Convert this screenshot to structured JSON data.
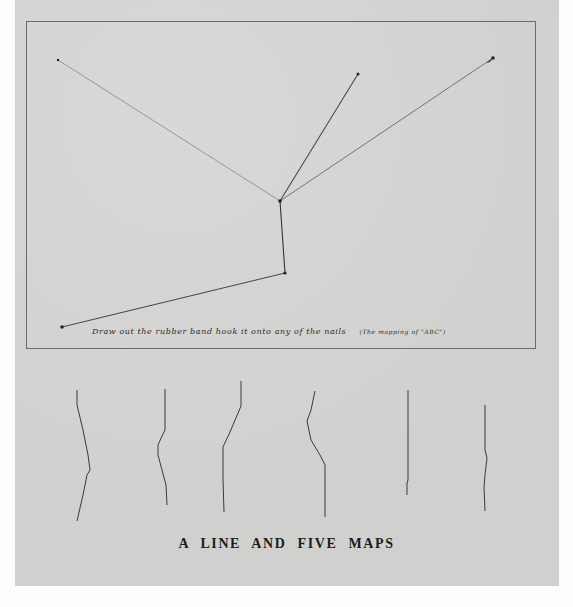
{
  "artwork": {
    "title": "A LINE AND FIVE MAPS",
    "instruction": "Draw out the rubber band hook it onto any of the nails",
    "instruction_note": "(The mapping of \"ABC\")",
    "colors": {
      "paper": "#d4d4d2",
      "background": "#fdfdfd",
      "ink": "#3a3a3a",
      "frame": "#6b6b6b"
    },
    "nails": [
      {
        "id": "top-left",
        "x": 58,
        "y": 60
      },
      {
        "id": "top-middle",
        "x": 358,
        "y": 74
      },
      {
        "id": "top-right",
        "x": 493,
        "y": 58
      },
      {
        "id": "center",
        "x": 280,
        "y": 201
      },
      {
        "id": "lower",
        "x": 285,
        "y": 273
      },
      {
        "id": "bottom-left",
        "x": 62,
        "y": 327
      }
    ],
    "maps_count": 5
  }
}
